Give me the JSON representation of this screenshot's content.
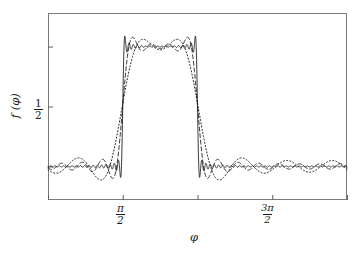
{
  "chart_data": {
    "type": "line",
    "title": "",
    "subtitle": "",
    "xlabel": "φ",
    "ylabel": "f (φ)",
    "grid": false,
    "legend": "none",
    "xlim": [
      0,
      6.283185307179586
    ],
    "ylim": [
      -0.28,
      1.28
    ],
    "x_ticks": [
      {
        "value": 0,
        "label": "0",
        "type": "plain"
      },
      {
        "value": 1.5707963267948966,
        "label": "π/2",
        "type": "fraction",
        "num": "π",
        "den": "2"
      },
      {
        "value": 3.141592653589793,
        "label": "π",
        "type": "plain-italic"
      },
      {
        "value": 4.71238898038469,
        "label": "3π/2",
        "type": "fraction",
        "num": "3π",
        "den": "2"
      },
      {
        "value": 6.283185307179586,
        "label": "2π",
        "type": "plain-italic"
      }
    ],
    "y_ticks": [
      {
        "value": 0,
        "label": "0",
        "type": "plain"
      },
      {
        "value": 0.5,
        "label": "1/2",
        "type": "fraction",
        "num": "1",
        "den": "2"
      },
      {
        "value": 1,
        "label": "1",
        "type": "plain"
      }
    ],
    "target_function": {
      "description": "Square pulse: f = 1 on [pi/2, pi], f = 0 elsewhere on [0, 2pi]",
      "pulse_start": 1.5707963267948966,
      "pulse_end": 3.141592653589793,
      "high_value": 1,
      "low_value": 0
    },
    "series": [
      {
        "name": "Fourier partial sum, low order",
        "style": "dotted",
        "harmonics": 6,
        "color": "#161616",
        "overshoot_peak": 1.02,
        "undershoot_min": -0.15
      },
      {
        "name": "Fourier partial sum, medium order",
        "style": "dashed",
        "harmonics": 14,
        "color": "#161616",
        "overshoot_peak": 1.15,
        "undershoot_min": -0.17
      },
      {
        "name": "Fourier partial sum, high order",
        "style": "solid",
        "harmonics": 70,
        "color": "#161616",
        "overshoot_peak": 1.18,
        "undershoot_min": -0.18
      }
    ],
    "phenomenon": "Gibbs phenomenon",
    "axis_color": "#7a7a7a",
    "curve_color": "#161616",
    "background_color": "#ffffff"
  },
  "figure": {
    "plot_area": {
      "left": 48,
      "top": 13,
      "right": 347,
      "bottom": 200
    }
  }
}
